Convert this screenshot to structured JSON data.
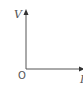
{
  "diagram": {
    "type": "axes",
    "y_axis_label": "V",
    "x_axis_label": "I",
    "origin_label": "O",
    "axis_color": "#555555"
  }
}
